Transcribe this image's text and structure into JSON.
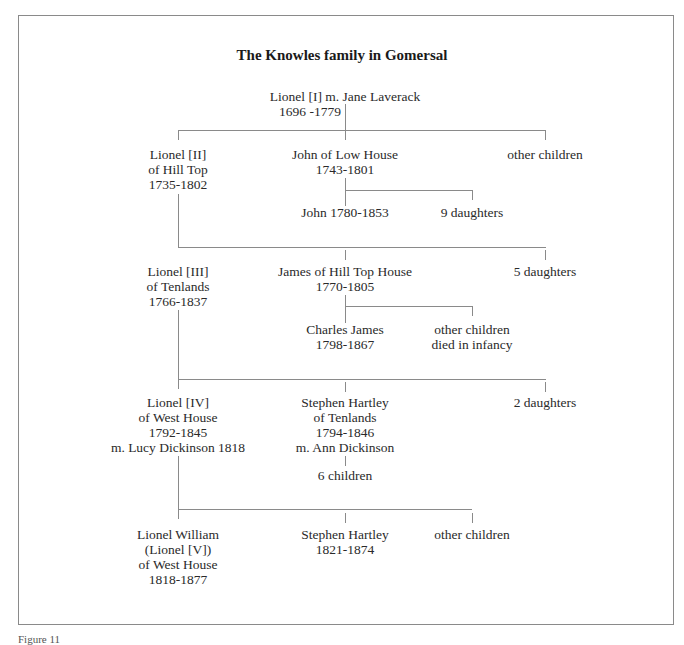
{
  "title": "The Knowles family in Gomersal",
  "caption": "Figure 11",
  "root": {
    "line1": "Lionel [I] m. Jane Laverack",
    "line2": "1696 -1779"
  },
  "gen2": {
    "left": {
      "lines": [
        "Lionel [II]",
        "of Hill Top",
        "1735-1802"
      ]
    },
    "middle": {
      "lines": [
        "John of Low House",
        "1743-1801"
      ]
    },
    "right": {
      "lines": [
        "other children"
      ]
    },
    "middle_children": [
      {
        "lines": [
          "John 1780-1853"
        ]
      },
      {
        "lines": [
          "9 daughters"
        ]
      }
    ]
  },
  "gen3": {
    "left": {
      "lines": [
        "Lionel [III]",
        "of Tenlands",
        "1766-1837"
      ]
    },
    "middle": {
      "lines": [
        "James of Hill Top House",
        "1770-1805"
      ]
    },
    "right": {
      "lines": [
        "5 daughters"
      ]
    },
    "middle_children": [
      {
        "lines": [
          "Charles James",
          "1798-1867"
        ]
      },
      {
        "lines": [
          "other children",
          "died in infancy"
        ]
      }
    ]
  },
  "gen4": {
    "left": {
      "lines": [
        "Lionel [IV]",
        "of West House",
        "1792-1845",
        "m. Lucy Dickinson 1818"
      ]
    },
    "middle": {
      "lines": [
        "Stephen Hartley",
        "of Tenlands",
        "1794-1846",
        "m. Ann Dickinson"
      ]
    },
    "middle_child": {
      "lines": [
        "6 children"
      ]
    },
    "right": {
      "lines": [
        "2 daughters"
      ]
    }
  },
  "gen5": {
    "left": {
      "lines": [
        "Lionel William",
        "(Lionel [V])",
        "of West House",
        "1818-1877"
      ]
    },
    "middle": {
      "lines": [
        "Stephen Hartley",
        "1821-1874"
      ]
    },
    "right": {
      "lines": [
        "other children"
      ]
    }
  }
}
